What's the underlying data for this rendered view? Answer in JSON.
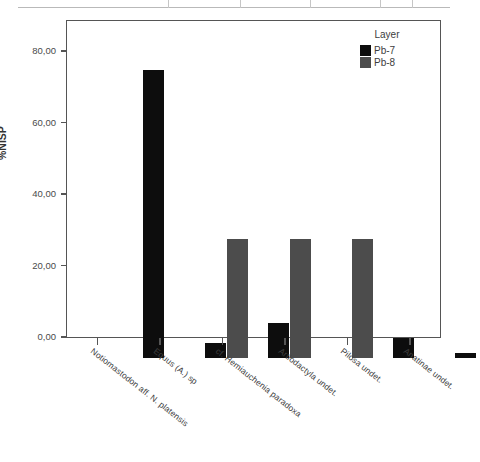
{
  "table_strip": {
    "divider_positions": [
      168,
      240,
      310,
      380,
      412
    ]
  },
  "chart_data": {
    "type": "bar",
    "title": "",
    "xlabel": "",
    "ylabel": "%NISP",
    "ylim": [
      0,
      90
    ],
    "ytick_values": [
      0,
      20,
      40,
      60,
      80
    ],
    "ytick_labels": [
      "0,00",
      "20,00",
      "40,00",
      "60,00",
      "80,00"
    ],
    "grid": false,
    "legend_position": "top-right",
    "legend_title": "Layer",
    "categories": [
      "Notiomastodon aff. N. platensis",
      "Equus (A.) sp",
      "cf. Hemiauchenia paradoxa",
      "Artiodactyla undet.",
      "Pilosa undet.",
      "Anatinae undet."
    ],
    "series": [
      {
        "name": "Pb-7",
        "color": "#0d0d0d",
        "values": [
          80.56,
          4.17,
          9.72,
          0.0,
          5.56,
          1.39
        ]
      },
      {
        "name": "Pb-8",
        "color": "#4c4c4c",
        "values": [
          0.0,
          33.33,
          33.33,
          33.33,
          0.0,
          0.0
        ]
      }
    ]
  },
  "colors": {
    "pb7": "#0d0d0d",
    "pb8": "#4c4c4c",
    "axis": "#555555",
    "text": "#3d3d3d"
  }
}
